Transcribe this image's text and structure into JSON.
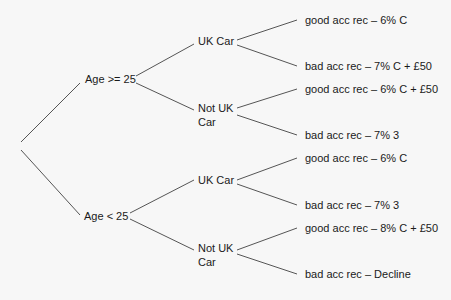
{
  "colors": {
    "background": "#f7f7f7",
    "line": "#555555",
    "text": "#1a1a1a"
  },
  "tree": {
    "root": "",
    "branches": [
      {
        "label": "Age >= 25",
        "children": [
          {
            "label": "UK Car",
            "leaves": [
              "good acc rec – 6% C",
              "bad acc rec – 7% C + £50"
            ]
          },
          {
            "label_line1": "Not UK",
            "label_line2": "Car",
            "leaves": [
              "good acc rec – 6% C + £50",
              "bad acc rec – 7% 3"
            ]
          }
        ]
      },
      {
        "label": "Age < 25",
        "children": [
          {
            "label": "UK Car",
            "leaves": [
              "good acc rec – 6% C",
              "bad acc rec – 7% 3"
            ]
          },
          {
            "label_line1": "Not UK",
            "label_line2": "Car",
            "leaves": [
              "good acc rec – 8% C + £50",
              "bad acc rec – Decline"
            ]
          }
        ]
      }
    ]
  }
}
